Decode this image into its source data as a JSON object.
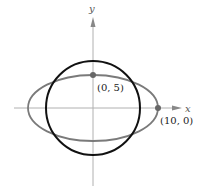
{
  "axes": {
    "x_label": "x",
    "y_label": "y",
    "axis_color": "#b0b0b0"
  },
  "curves": {
    "circle": {
      "color": "#111111",
      "stroke_width": 2
    },
    "ellipse": {
      "color": "#7a7a7a",
      "stroke_width": 1.8
    }
  },
  "points": [
    {
      "label": "(0, 5)",
      "color": "#666666"
    },
    {
      "label": "(10, 0)",
      "color": "#666666"
    }
  ]
}
